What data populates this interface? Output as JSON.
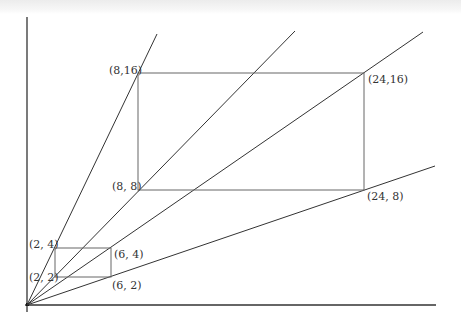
{
  "diagram": {
    "axes": {
      "origin_px": [
        27,
        305
      ],
      "y_axis_top_px": 17,
      "x_axis_right_px": 436,
      "color": "#333333"
    },
    "rays": [
      {
        "name": "ray-slope-2",
        "end_px": [
          157,
          34
        ]
      },
      {
        "name": "ray-slope-1",
        "end_px": [
          295,
          31
        ]
      },
      {
        "name": "ray-slope-0.5",
        "end_px": [
          423,
          32
        ]
      },
      {
        "name": "ray-slope-0.25",
        "end_px": [
          435,
          166
        ]
      }
    ],
    "small_rectangle": {
      "corners": {
        "top_left": {
          "label": "(2, 4)",
          "px": [
            55,
            248
          ]
        },
        "top_right": {
          "label": "(6, 4)",
          "px": [
            111,
            248
          ]
        },
        "bottom_left": {
          "label": "(2, 2)",
          "px": [
            55,
            277
          ]
        },
        "bottom_right": {
          "label": "(6, 2)",
          "px": [
            111,
            277
          ]
        }
      }
    },
    "large_rectangle": {
      "corners": {
        "top_left": {
          "label": "(8,16)",
          "px": [
            138,
            73
          ]
        },
        "top_right": {
          "label": "(24,16)",
          "px": [
            364,
            73
          ]
        },
        "bottom_left": {
          "label": "(8, 8)",
          "px": [
            138,
            190
          ]
        },
        "bottom_right": {
          "label": "(24, 8)",
          "px": [
            364,
            190
          ]
        }
      }
    },
    "line_color": "#333333",
    "rect_color": "#666666"
  }
}
